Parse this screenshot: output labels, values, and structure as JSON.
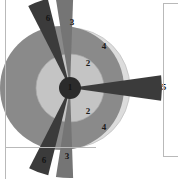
{
  "figure": {
    "background_color": "#ffffff",
    "frame_color": "#b9b9b9",
    "center": {
      "x": 70,
      "y": 88
    },
    "hub": {
      "label": "1",
      "radius": 11,
      "color": "#2b2b2b",
      "label_color": "#141414"
    },
    "rings": [
      {
        "label": "2",
        "radius": 34,
        "color": "#c4c4c4",
        "label_positions": [
          {
            "x": 88,
            "y": 64
          },
          {
            "x": 88,
            "y": 112
          }
        ]
      },
      {
        "label": "4",
        "radius": 60,
        "color": "#dcdcdc",
        "label_positions": [
          {
            "x": 104,
            "y": 47
          },
          {
            "x": 104,
            "y": 128
          }
        ]
      }
    ],
    "big_circle": {
      "radius": 62,
      "color": "#8a8a8a",
      "center": {
        "x": 62,
        "y": 88
      }
    },
    "wedges": [
      {
        "label": "6",
        "color": "#3b3b3b",
        "start_angle": 243,
        "end_angle": 256,
        "radius": 92,
        "label_position": {
          "x": 48,
          "y": 18
        }
      },
      {
        "label": "3",
        "color": "#757575",
        "start_angle": 261,
        "end_angle": 272,
        "radius": 90,
        "label_position": {
          "x": 72,
          "y": 22
        }
      },
      {
        "label": "5",
        "color": "#3b3b3b",
        "start_angle": 352,
        "end_angle": 8,
        "radius": 92,
        "label_position": {
          "x": 163,
          "y": 88
        }
      },
      {
        "label": "3",
        "color": "#757575",
        "start_angle": 88,
        "end_angle": 99,
        "radius": 90,
        "label_position": {
          "x": 67,
          "y": 157
        }
      },
      {
        "label": "6",
        "color": "#3b3b3b",
        "start_angle": 104,
        "end_angle": 117,
        "radius": 90,
        "label_position": {
          "x": 44,
          "y": 160
        }
      }
    ],
    "frame_lines": [
      {
        "name": "left-frame-line",
        "x1": 5,
        "y1": 0,
        "x2": 5,
        "y2": 179
      },
      {
        "name": "right-frame-line",
        "x1": 163,
        "y1": 3,
        "x2": 163,
        "y2": 156
      },
      {
        "name": "right-frame-top-cap",
        "x1": 163,
        "y1": 3,
        "x2": 178,
        "y2": 3
      },
      {
        "name": "right-frame-bottom-cap",
        "x1": 163,
        "y1": 156,
        "x2": 178,
        "y2": 156
      },
      {
        "name": "baseline-rule",
        "x1": 6,
        "y1": 147,
        "x2": 96,
        "y2": 147
      }
    ]
  },
  "labels": {
    "hub": "1",
    "ring_inner": "2",
    "ring_outer": "4",
    "wedge_top_left": "6",
    "wedge_top": "3",
    "wedge_right": "5",
    "wedge_bottom": "3",
    "wedge_bottom_left": "6"
  }
}
